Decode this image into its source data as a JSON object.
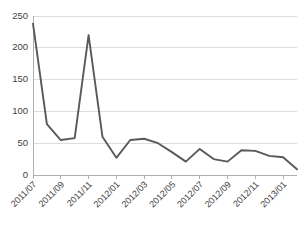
{
  "chart_data": {
    "type": "line",
    "title": "",
    "subtitle": "",
    "xlabel": "",
    "ylabel": "",
    "ylim": [
      0,
      250
    ],
    "yticks": [
      0,
      50,
      100,
      150,
      200,
      250
    ],
    "grid": true,
    "legend": false,
    "legend_position": "none",
    "line_color": "#595959",
    "x": [
      "2011/07",
      "2011/08",
      "2011/09",
      "2011/10",
      "2011/11",
      "2011/12",
      "2012/01",
      "2012/02",
      "2012/03",
      "2012/04",
      "2012/05",
      "2012/06",
      "2012/07",
      "2012/08",
      "2012/09",
      "2012/10",
      "2012/11",
      "2012/12",
      "2013/01",
      "2013/02"
    ],
    "values": [
      238,
      80,
      55,
      58,
      220,
      60,
      27,
      55,
      57,
      50,
      36,
      21,
      41,
      25,
      21,
      39,
      38,
      30,
      28,
      9
    ],
    "xtick_labels": [
      "2011/07",
      "2011/09",
      "2011/11",
      "2012/01",
      "2012/03",
      "2012/05",
      "2012/07",
      "2012/09",
      "2012/11",
      "2013/01"
    ],
    "xtick_indices": [
      0,
      2,
      4,
      6,
      8,
      10,
      12,
      14,
      16,
      18
    ]
  }
}
